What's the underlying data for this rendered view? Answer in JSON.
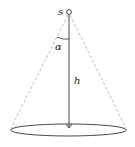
{
  "diagram": {
    "labels": {
      "source": "s",
      "angle": "α",
      "height": "h"
    },
    "colors": {
      "line": "#333333",
      "dashed": "#aaaaaa"
    }
  }
}
